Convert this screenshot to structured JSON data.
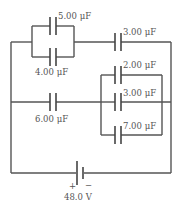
{
  "diagram": {
    "type": "capacitor-circuit",
    "capacitors": [
      {
        "id": "c5",
        "label": "5.00 μF"
      },
      {
        "id": "c4",
        "label": "4.00 μF"
      },
      {
        "id": "c3top",
        "label": "3.00 μF"
      },
      {
        "id": "c2",
        "label": "2.00 μF"
      },
      {
        "id": "c3mid",
        "label": "3.00 μF"
      },
      {
        "id": "c7",
        "label": "7.00 μF"
      },
      {
        "id": "c6",
        "label": "6.00 μF"
      }
    ],
    "battery": {
      "plus": "+",
      "minus": "−",
      "label": "48.0 V"
    }
  }
}
